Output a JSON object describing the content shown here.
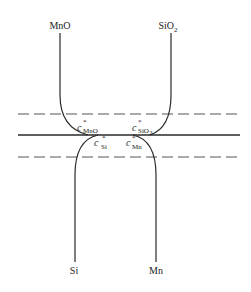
{
  "diagram": {
    "title": "",
    "colors": {
      "line": "#2a2a2a",
      "dash": "#555555",
      "background": "#ffffff"
    },
    "phases": {
      "top_left": {
        "label": "MnO"
      },
      "top_right": {
        "label_main": "SiO",
        "label_sub": "2"
      },
      "bottom_left": {
        "label": "Si"
      },
      "bottom_right": {
        "label": "Mn"
      }
    },
    "interface": {
      "type": "solid",
      "description": "slag/metal interface"
    },
    "boundary_layers": [
      {
        "position": "upper",
        "style": "dashed"
      },
      {
        "position": "lower",
        "style": "dashed"
      }
    ],
    "concentrations": [
      {
        "symbol": "c",
        "superscript": "*",
        "subscript": "MnO",
        "side": "upper"
      },
      {
        "symbol": "c",
        "superscript": "*",
        "subscript": "SiO",
        "subscript2": "2",
        "side": "upper"
      },
      {
        "symbol": "c",
        "superscript": "*",
        "subscript": "Si",
        "side": "lower"
      },
      {
        "symbol": "c",
        "superscript": "*",
        "subscript": "Mn",
        "side": "lower"
      }
    ]
  }
}
